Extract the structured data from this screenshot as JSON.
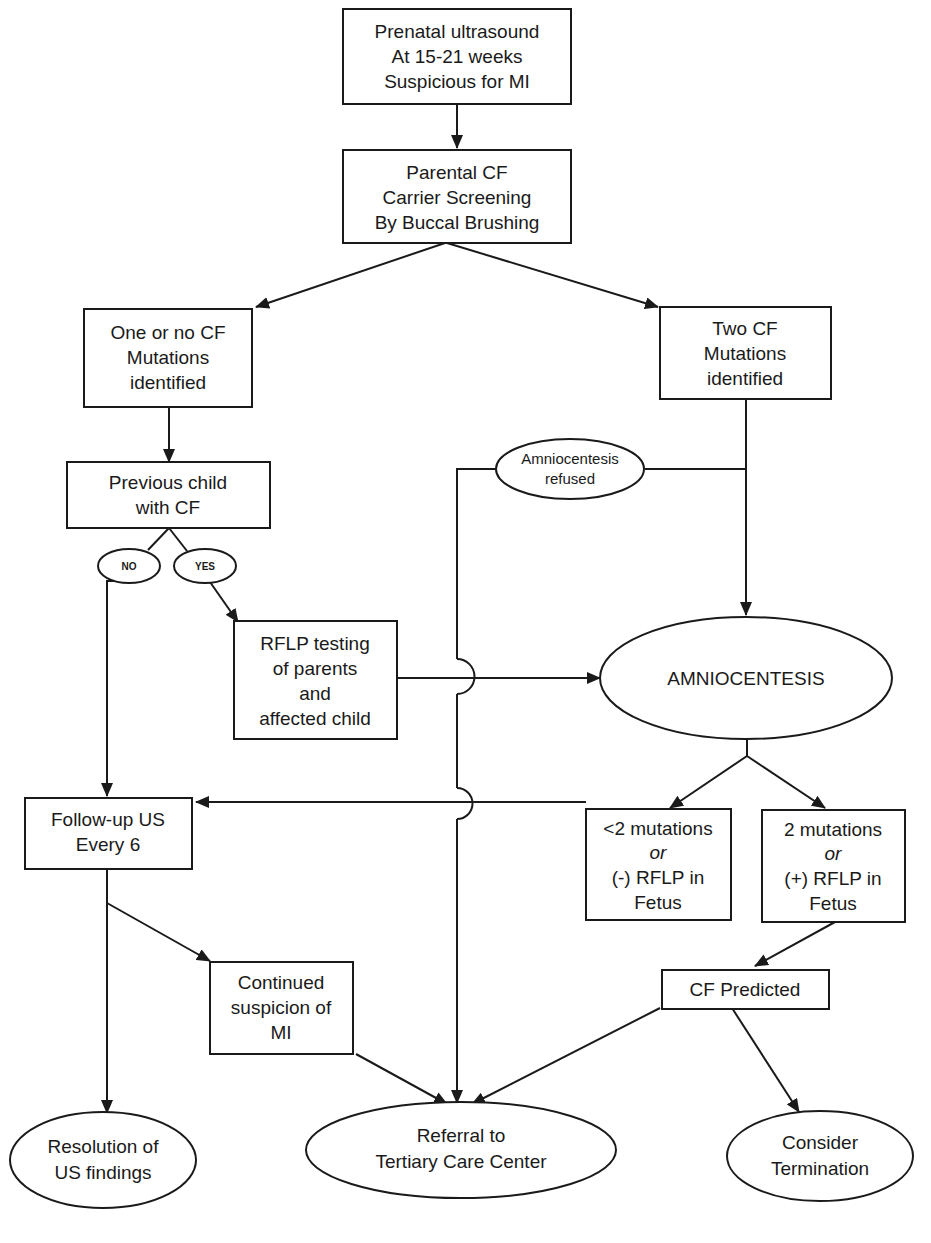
{
  "diagram": {
    "type": "flowchart",
    "nodes": {
      "prenatal_us": {
        "shape": "rect",
        "lines": [
          "Prenatal ultrasound",
          "At 15-21 weeks",
          "Suspicious for MI"
        ]
      },
      "parental_screening": {
        "shape": "rect",
        "lines": [
          "Parental CF",
          "Carrier Screening",
          "By Buccal Brushing"
        ]
      },
      "one_or_no": {
        "shape": "rect",
        "lines": [
          "One or no CF",
          "Mutations",
          "identified"
        ]
      },
      "two_cf": {
        "shape": "rect",
        "lines": [
          "Two CF",
          "Mutations",
          "identified"
        ]
      },
      "previous_child": {
        "shape": "rect",
        "lines": [
          "Previous child",
          "with CF"
        ]
      },
      "no_label": {
        "shape": "ellipse",
        "lines": [
          "NO"
        ]
      },
      "yes_label": {
        "shape": "ellipse",
        "lines": [
          "YES"
        ]
      },
      "amnio_refused": {
        "shape": "ellipse",
        "lines": [
          "Amniocentesis",
          "refused"
        ]
      },
      "rflp_testing": {
        "shape": "rect",
        "lines": [
          "RFLP testing",
          "of parents",
          "and",
          "affected child"
        ]
      },
      "amniocentesis": {
        "shape": "ellipse",
        "lines": [
          "AMNIOCENTESIS"
        ]
      },
      "followup_us": {
        "shape": "rect",
        "lines": [
          "Follow-up US",
          "Every 6"
        ]
      },
      "less_than_2": {
        "shape": "rect",
        "lines": [
          "<2 mutations",
          "or",
          "(-) RFLP in",
          "Fetus"
        ]
      },
      "two_mutations": {
        "shape": "rect",
        "lines": [
          "2 mutations",
          "or",
          "(+) RFLP in",
          "Fetus"
        ]
      },
      "continued_suspicion": {
        "shape": "rect",
        "lines": [
          "Continued",
          "suspicion of",
          "MI"
        ]
      },
      "cf_predicted": {
        "shape": "rect",
        "lines": [
          "CF Predicted"
        ]
      },
      "resolution": {
        "shape": "ellipse",
        "lines": [
          "Resolution of",
          "US findings"
        ]
      },
      "referral": {
        "shape": "ellipse",
        "lines": [
          "Referral to",
          "Tertiary Care Center"
        ]
      },
      "consider_termination": {
        "shape": "ellipse",
        "lines": [
          "Consider",
          "Termination"
        ]
      }
    },
    "edges": [
      [
        "prenatal_us",
        "parental_screening"
      ],
      [
        "parental_screening",
        "one_or_no"
      ],
      [
        "parental_screening",
        "two_cf"
      ],
      [
        "one_or_no",
        "previous_child"
      ],
      [
        "previous_child",
        "no_label"
      ],
      [
        "previous_child",
        "yes_label"
      ],
      [
        "no_label",
        "followup_us"
      ],
      [
        "yes_label",
        "rflp_testing"
      ],
      [
        "rflp_testing",
        "amniocentesis"
      ],
      [
        "two_cf",
        "amniocentesis"
      ],
      [
        "two_cf",
        "amnio_refused"
      ],
      [
        "amnio_refused",
        "referral"
      ],
      [
        "amniocentesis",
        "less_than_2"
      ],
      [
        "amniocentesis",
        "two_mutations"
      ],
      [
        "less_than_2",
        "followup_us"
      ],
      [
        "two_mutations",
        "cf_predicted"
      ],
      [
        "followup_us",
        "continued_suspicion"
      ],
      [
        "followup_us",
        "resolution"
      ],
      [
        "continued_suspicion",
        "referral"
      ],
      [
        "cf_predicted",
        "referral"
      ],
      [
        "cf_predicted",
        "consider_termination"
      ]
    ],
    "line_color": "#1a1a1a",
    "background": "#ffffff"
  }
}
